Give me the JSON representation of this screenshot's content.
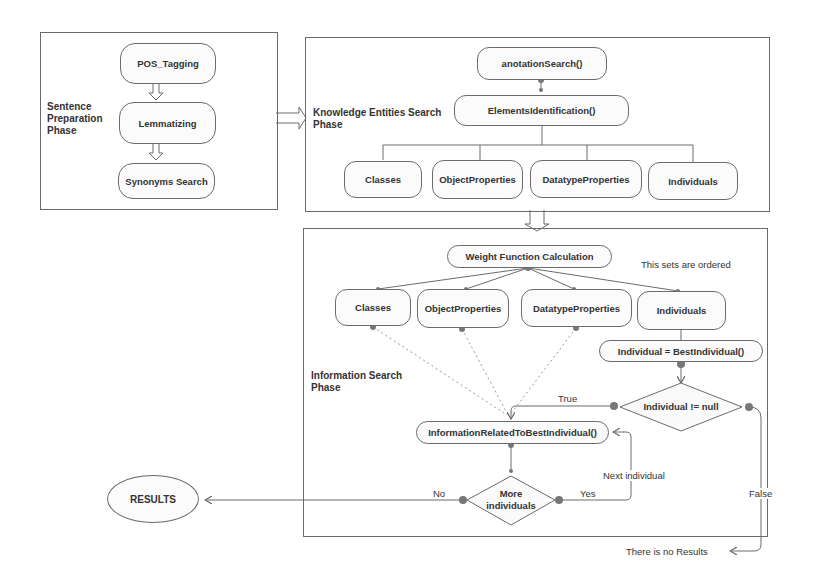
{
  "phases": {
    "sentence_preparation": {
      "label_lines": [
        "Sentence",
        "Preparation",
        "Phase"
      ],
      "steps": [
        "POS_Tagging",
        "Lemmatizing",
        "Synonyms Search"
      ]
    },
    "knowledge_entities_search": {
      "label_lines": [
        "Knowledge Entities Search",
        "Phase"
      ],
      "root": "anotationSearch()",
      "identification": "ElementsIdentification()",
      "entities": [
        "Classes",
        "ObjectProperties",
        "DatatypeProperties",
        "Individuals"
      ]
    },
    "information_search": {
      "label_lines": [
        "Information Search",
        "Phase"
      ],
      "weight": "Weight Function Calculation",
      "note": "This sets are ordered",
      "sets": [
        "Classes",
        "ObjectProperties",
        "DatatypeProperties",
        "Individuals"
      ],
      "best_individual": "Individual = BestIndividual()",
      "decision_null": "Individual != null",
      "info_related": "InformationRelatedToBestIndividual()",
      "decision_more_lines": [
        "More",
        "individuals"
      ],
      "edge_labels": {
        "true": "True",
        "false": "False",
        "yes": "Yes",
        "no": "No",
        "next": "Next individual"
      }
    }
  },
  "results": "RESULTS",
  "no_results": "There is no Results"
}
